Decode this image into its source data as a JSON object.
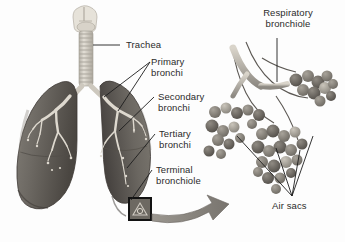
{
  "figure": {
    "style": "grayscale anatomical illustration",
    "background_color": "#fdfdfd"
  },
  "labels": {
    "trachea": "Trachea",
    "primary_bronchi": "Primary\nbronchi",
    "secondary_bronchi": "Secondary\nbronchi",
    "tertiary_bronchi": "Tertiary\nbronchi",
    "terminal_bronchiole": "Terminal\nbronchiole",
    "respiratory_bronchiole": "Respiratory\nbronchiole",
    "air_sacs": "Air sacs"
  },
  "colors": {
    "text": "#2b2b2b",
    "leader_line": "#1d1d1d",
    "lung_body": "#6e6a64",
    "lung_shadow": "#46423d",
    "lung_highlight": "#8e8a83",
    "trachea": "#d6d2c9",
    "trachea_ring": "#a9a49a",
    "bronchial_tree": "#ded9cf",
    "alveoli_dark": "#5d5953",
    "alveoli_mid": "#7e7a73",
    "alveoli_light": "#a9a49c",
    "arrow": "#8b8781",
    "inset_box": "#121212"
  },
  "parts": {
    "larynx": "larynx",
    "trachea_tube": "trachea with cartilage rings",
    "left_lung": "left lung",
    "right_lung": "right lung",
    "oblique_fissure": "oblique fissure",
    "left_bronchial_tree": "left bronchial tree",
    "right_bronchial_tree": "right bronchial tree",
    "inset_box": "magnification source box",
    "magnify_arrow": "magnification arrow",
    "alveolar_cluster_upper": "upper alveolar sac cluster",
    "alveolar_cluster_left": "left alveolar sac cluster",
    "alveolar_cluster_lower": "lower alveolar sac cluster",
    "respiratory_bronchiole_tube": "respiratory bronchiole"
  }
}
